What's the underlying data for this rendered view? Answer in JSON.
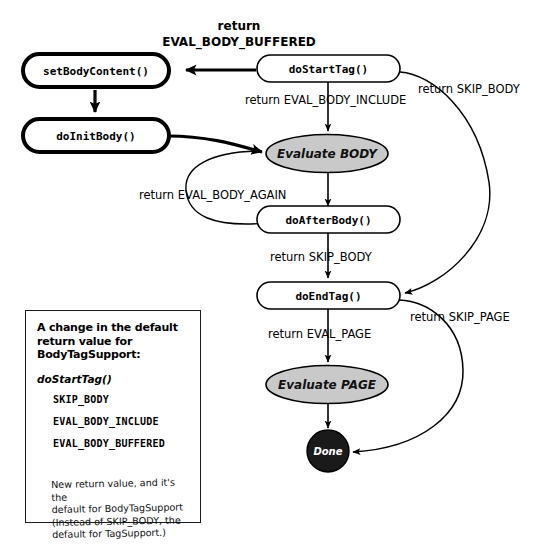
{
  "diagram": {
    "title_lines": [
      "return",
      "EVAL_BODY_BUFFERED"
    ],
    "nodes": {
      "set_body_content": "setBodyContent()",
      "do_init_body": "doInitBody()",
      "do_start_tag": "doStartTag()",
      "evaluate_body": "Evaluate BODY",
      "do_after_body": "doAfterBody()",
      "do_end_tag": "doEndTag()",
      "evaluate_page": "Evaluate PAGE",
      "done": "Done"
    },
    "edges": {
      "eval_body_include": "return EVAL_BODY_INCLUDE",
      "skip_body_start": "return SKIP_BODY",
      "eval_body_again": "return EVAL_BODY_AGAIN",
      "skip_body_after": "return SKIP_BODY",
      "eval_page": "return EVAL_PAGE",
      "skip_page": "return SKIP_PAGE"
    },
    "colors": {
      "stroke": "#000000",
      "ellipse_fill": "#c9c9c9",
      "done_fill": "#1a1a1a",
      "background": "#ffffff"
    }
  },
  "note": {
    "heading": "A change in the default return value for BodyTagSupport:",
    "signature": "doStartTag()",
    "constants": [
      "SKIP_BODY",
      "EVAL_BODY_INCLUDE",
      "EVAL_BODY_BUFFERED"
    ],
    "handwritten": "New return value, and it's the\ndefault for BodyTagSupport\n(Instead of SKIP_BODY, the\ndefault for TagSupport.)"
  }
}
